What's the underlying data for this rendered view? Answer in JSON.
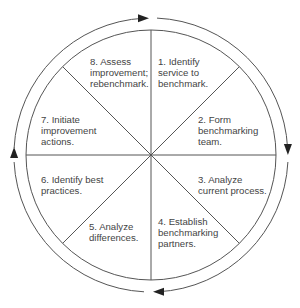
{
  "diagram": {
    "colors": {
      "line": "#555555",
      "text": "#444444",
      "arrow": "#222222",
      "background": "#ffffff"
    },
    "center": {
      "x": 151,
      "y": 155
    },
    "inner_radius": 125,
    "outer_radius": 137,
    "flow_direction": "clockwise",
    "steps": [
      {
        "id": 1,
        "lines": [
          "1. Identify",
          "service to",
          "benchmark."
        ],
        "x": 158,
        "y": 56
      },
      {
        "id": 2,
        "lines": [
          "2. Form",
          "benchmarking",
          "team."
        ],
        "x": 198,
        "y": 114
      },
      {
        "id": 3,
        "lines": [
          "3. Analyze",
          "current process."
        ],
        "x": 198,
        "y": 174
      },
      {
        "id": 4,
        "lines": [
          "4. Establish",
          "benchmarking",
          "partners."
        ],
        "x": 158,
        "y": 216
      },
      {
        "id": 5,
        "lines": [
          "5. Analyze",
          "differences."
        ],
        "x": 89,
        "y": 221
      },
      {
        "id": 6,
        "lines": [
          "6. Identify best",
          "practices."
        ],
        "x": 41,
        "y": 174
      },
      {
        "id": 7,
        "lines": [
          "7. Initiate",
          "improvement",
          "actions."
        ],
        "x": 41,
        "y": 114
      },
      {
        "id": 8,
        "lines": [
          "8. Assess",
          "improvement;",
          "rebenchmark."
        ],
        "x": 90,
        "y": 56
      }
    ],
    "arrows": [
      {
        "position": "top",
        "direction": "right"
      },
      {
        "position": "right",
        "direction": "down"
      },
      {
        "position": "bottom",
        "direction": "left"
      },
      {
        "position": "left",
        "direction": "up"
      }
    ]
  }
}
